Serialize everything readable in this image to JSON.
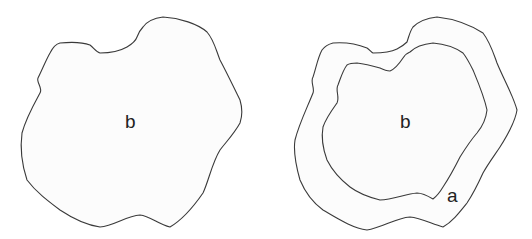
{
  "diagram": {
    "left_figure": {
      "region_label": "b"
    },
    "right_figure": {
      "inner_region_label": "b",
      "ring_region_label": "a"
    },
    "colors": {
      "stroke": "#3a3a3a",
      "fill": "#fcfcfc",
      "background": "#ffffff"
    }
  }
}
